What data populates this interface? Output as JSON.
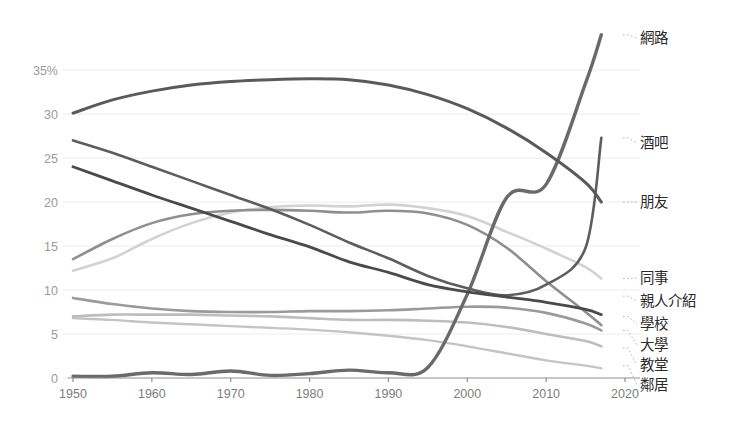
{
  "chart_data": {
    "type": "line",
    "title": "",
    "subtitle": "",
    "xlabel": "",
    "ylabel": "",
    "xlim": [
      1950,
      2020
    ],
    "ylim": [
      0,
      40
    ],
    "grid": true,
    "legend_position": "right-inline-labels",
    "x_ticks": [
      "1950",
      "1960",
      "1970",
      "1980",
      "1990",
      "2000",
      "2010",
      "2020"
    ],
    "x_tick_values": [
      1950,
      1960,
      1970,
      1980,
      1990,
      2000,
      2010,
      2020
    ],
    "y_ticks": [
      "0",
      "5",
      "10",
      "15",
      "20",
      "25",
      "30",
      "35%"
    ],
    "y_tick_values": [
      0,
      5,
      10,
      15,
      20,
      25,
      30,
      35
    ],
    "x": [
      1950,
      1955,
      1960,
      1965,
      1970,
      1975,
      1980,
      1985,
      1990,
      1995,
      2000,
      2005,
      2010,
      2015,
      2017
    ],
    "series": [
      {
        "name": "網路",
        "label": "網路",
        "color": "#6a6a6a",
        "width": 3.4,
        "label_y": 39.0,
        "values": [
          0.2,
          0.2,
          0.6,
          0.4,
          0.8,
          0.3,
          0.5,
          0.9,
          0.6,
          1.2,
          9.5,
          20.5,
          22.0,
          33.5,
          39.0
        ]
      },
      {
        "name": "酒吧",
        "label": "酒吧",
        "color": "#5d5d5d",
        "width": 2.6,
        "label_y": 27.3,
        "values": [
          27.0,
          25.6,
          24.0,
          22.4,
          20.8,
          19.2,
          17.4,
          15.4,
          13.6,
          11.6,
          10.2,
          9.4,
          10.6,
          14.8,
          27.3
        ]
      },
      {
        "name": "朋友",
        "label": "朋友",
        "color": "#5a5a5a",
        "width": 3.0,
        "label_y": 20.0,
        "values": [
          30.1,
          31.6,
          32.6,
          33.3,
          33.7,
          33.9,
          34.0,
          33.9,
          33.3,
          32.2,
          30.6,
          28.4,
          25.6,
          22.2,
          20.0
        ]
      },
      {
        "name": "同事",
        "label": "同事",
        "color": "#d2d2d2",
        "width": 2.6,
        "label_y": 11.3,
        "values": [
          12.2,
          13.6,
          15.8,
          17.6,
          18.8,
          19.4,
          19.6,
          19.5,
          19.7,
          19.3,
          18.4,
          16.6,
          14.7,
          12.6,
          11.3
        ]
      },
      {
        "name": "親人介紹",
        "label": "親人介紹",
        "color": "#4a4a4a",
        "width": 2.8,
        "label_y": 9.3,
        "values": [
          24.0,
          22.4,
          20.8,
          19.3,
          17.8,
          16.3,
          14.9,
          13.2,
          12.0,
          10.6,
          9.8,
          9.2,
          8.6,
          7.8,
          7.2
        ]
      },
      {
        "name": "學校",
        "label": "學校",
        "color": "#8f8f8f",
        "width": 2.6,
        "label_y": 7.0,
        "values": [
          13.5,
          15.8,
          17.6,
          18.6,
          19.0,
          19.1,
          19.0,
          18.8,
          19.0,
          18.7,
          17.4,
          14.8,
          11.0,
          7.5,
          6.0
        ]
      },
      {
        "name": "大學",
        "label": "大學",
        "color": "#9a9a9a",
        "width": 2.6,
        "label_y": 5.4,
        "values": [
          9.1,
          8.4,
          7.9,
          7.6,
          7.5,
          7.5,
          7.6,
          7.6,
          7.7,
          7.9,
          8.1,
          8.0,
          7.4,
          6.2,
          5.4
        ]
      },
      {
        "name": "教堂",
        "label": "教堂",
        "color": "#bdbdbd",
        "width": 2.6,
        "label_y": 3.4,
        "values": [
          7.0,
          7.2,
          7.2,
          7.2,
          7.1,
          7.0,
          6.8,
          6.6,
          6.6,
          6.5,
          6.3,
          5.8,
          5.0,
          4.2,
          3.6
        ]
      },
      {
        "name": "鄰居",
        "label": "鄰居",
        "color": "#c4c4c4",
        "width": 2.4,
        "label_y": 1.4,
        "values": [
          6.8,
          6.6,
          6.3,
          6.1,
          5.9,
          5.7,
          5.5,
          5.2,
          4.8,
          4.3,
          3.6,
          2.8,
          2.0,
          1.4,
          1.1
        ]
      }
    ]
  }
}
